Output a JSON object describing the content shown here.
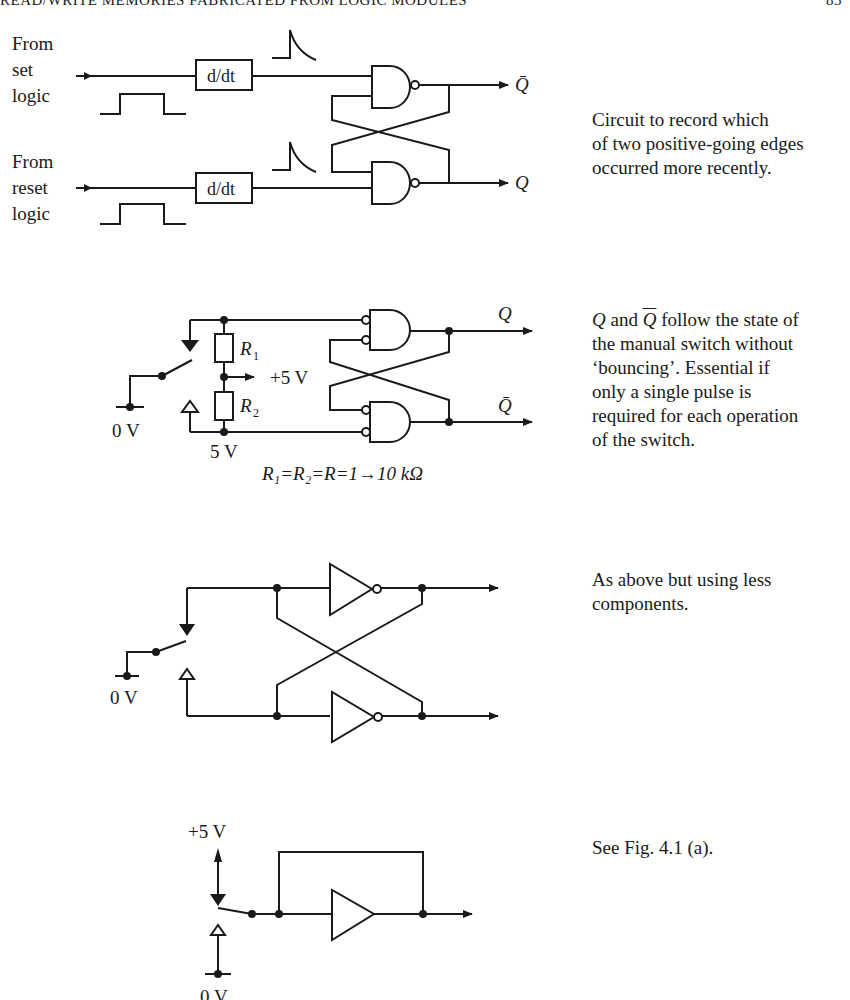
{
  "header": {
    "running_title": "READ/WRITE MEMORIES FABRICATED FROM LOGIC MODULES",
    "page_number": "85"
  },
  "figures": [
    {
      "id": "edge-recorder",
      "labels": {
        "set_input": [
          "From",
          "set",
          "logic"
        ],
        "reset_input": [
          "From",
          "reset",
          "logic"
        ],
        "differentiator": "d/dt",
        "output_top": "Q̄",
        "output_bottom": "Q"
      },
      "caption": [
        "Circuit to record which",
        "of two positive-going edges",
        "occurred more recently."
      ]
    },
    {
      "id": "debounce-nand",
      "labels": {
        "r1": "R",
        "r1_sub": "1",
        "r2": "R",
        "r2_sub": "2",
        "supply": "+5 V",
        "ground": "0 V",
        "node_5v": "5 V",
        "output_top": "Q",
        "output_bottom": "Q̄",
        "equation": "R₁=R₂=R=1→10 kΩ"
      },
      "caption_parts": {
        "q": "Q",
        "and": " and ",
        "qbar": "Q",
        "rest_first": " follow the state of"
      },
      "caption": [
        "the manual switch without",
        "‘bouncing’. Essential if",
        "only a single pulse is",
        "required for each operation",
        "of the switch."
      ]
    },
    {
      "id": "debounce-inverters",
      "labels": {
        "ground": "0 V"
      },
      "caption": [
        "As above but using less",
        "components."
      ]
    },
    {
      "id": "debounce-buffer",
      "labels": {
        "supply": "+5 V",
        "ground": "0 V"
      },
      "caption": [
        "See Fig. 4.1 (a)."
      ]
    }
  ]
}
